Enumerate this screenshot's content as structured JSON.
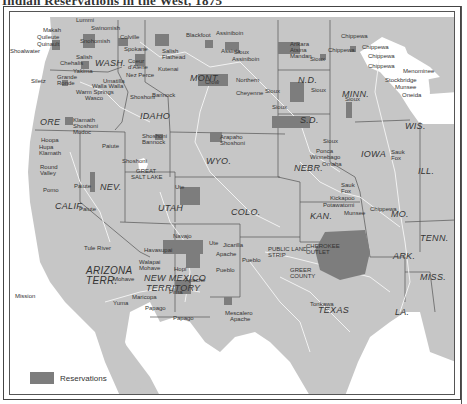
{
  "title": "Indian Reservations in the West, 1875",
  "colors": {
    "land": "#c6c6c6",
    "water": "#ffffff",
    "reservation": "#7d7d7d",
    "rivers": "#f2f2f2",
    "borders": "#555555"
  },
  "legend": {
    "label": "Reservations"
  },
  "states": [
    {
      "id": "wash",
      "label": "WASH.",
      "x": 95,
      "y": 52
    },
    {
      "id": "ore",
      "label": "ORE",
      "x": 38,
      "y": 108
    },
    {
      "id": "idaho",
      "label": "IDAHO",
      "x": 132,
      "y": 112
    },
    {
      "id": "mont",
      "label": "MONT.",
      "x": 186,
      "y": 69
    },
    {
      "id": "wyo",
      "label": "WYO.",
      "x": 197,
      "y": 152
    },
    {
      "id": "nd",
      "label": "N.D.",
      "x": 288,
      "y": 71
    },
    {
      "id": "sd",
      "label": "S.D.",
      "x": 289,
      "y": 114
    },
    {
      "id": "nebr",
      "label": "NEBR.",
      "x": 286,
      "y": 158
    },
    {
      "id": "minn",
      "label": "MINN.",
      "x": 333,
      "y": 85
    },
    {
      "id": "wis",
      "label": "WIS.",
      "x": 395,
      "y": 115
    },
    {
      "id": "iowa",
      "label": "IOWA",
      "x": 353,
      "y": 153
    },
    {
      "id": "ill",
      "label": "ILL.",
      "x": 408,
      "y": 160
    },
    {
      "id": "nev",
      "label": "NEV.",
      "x": 88,
      "y": 167
    },
    {
      "id": "calif",
      "label": "CALIF.",
      "x": 45,
      "y": 195
    },
    {
      "id": "utah",
      "label": "UTAH",
      "x": 147,
      "y": 197
    },
    {
      "id": "colo",
      "label": "COLO.",
      "x": 223,
      "y": 204
    },
    {
      "id": "kan",
      "label": "KAN.",
      "x": 304,
      "y": 213
    },
    {
      "id": "mo",
      "label": "MO.",
      "x": 379,
      "y": 202
    },
    {
      "id": "arizona",
      "label": "ARIZONA",
      "x": 70,
      "y": 263
    },
    {
      "id": "arizona-terr",
      "label": "TERR.",
      "x": 70,
      "y": 274
    },
    {
      "id": "new-mexico",
      "label": "NEW MEXICO",
      "x": 138,
      "y": 269
    },
    {
      "id": "new-mexico-terr",
      "label": "TERRITORY",
      "x": 138,
      "y": 280
    },
    {
      "id": "texas",
      "label": "TEXAS",
      "x": 310,
      "y": 302
    },
    {
      "id": "ark",
      "label": "ARK.",
      "x": 382,
      "y": 248
    },
    {
      "id": "tenn",
      "label": "TENN.",
      "x": 418,
      "y": 225
    },
    {
      "id": "miss",
      "label": "MISS.",
      "x": 418,
      "y": 268
    },
    {
      "id": "la",
      "label": "LA.",
      "x": 393,
      "y": 297
    }
  ],
  "places": [
    {
      "label": "Makah",
      "x": 33,
      "y": 15
    },
    {
      "label": "Quileute",
      "x": 27,
      "y": 22
    },
    {
      "label": "Quinault",
      "x": 27,
      "y": 29
    },
    {
      "label": "Shoalwater",
      "x": 0,
      "y": 36
    },
    {
      "label": "Lummi",
      "x": 66,
      "y": 5
    },
    {
      "label": "Swinomish",
      "x": 81,
      "y": 13
    },
    {
      "label": "Snohomish",
      "x": 70,
      "y": 26
    },
    {
      "label": "Salish",
      "x": 66,
      "y": 42
    },
    {
      "label": "Chehalis",
      "x": 50,
      "y": 48
    },
    {
      "label": "Yakima",
      "x": 63,
      "y": 56
    },
    {
      "label": "Siletz",
      "x": 21,
      "y": 66
    },
    {
      "label": "Grande",
      "x": 47,
      "y": 62
    },
    {
      "label": "Ronde",
      "x": 47,
      "y": 68
    },
    {
      "label": "Umatilla",
      "x": 93,
      "y": 66
    },
    {
      "label": "Walla Walla",
      "x": 82,
      "y": 71
    },
    {
      "label": "Warm Springs",
      "x": 66,
      "y": 77
    },
    {
      "label": "Wasco",
      "x": 75,
      "y": 83
    },
    {
      "label": "Klamath",
      "x": 63,
      "y": 105
    },
    {
      "label": "Shoshoni",
      "x": 63,
      "y": 111
    },
    {
      "label": "Modoc",
      "x": 63,
      "y": 117
    },
    {
      "label": "Colville",
      "x": 110,
      "y": 22
    },
    {
      "label": "Spokane",
      "x": 114,
      "y": 34
    },
    {
      "label": "Coeur",
      "x": 118,
      "y": 46
    },
    {
      "label": "d'Alene",
      "x": 118,
      "y": 52
    },
    {
      "label": "Nez Perce",
      "x": 116,
      "y": 60
    },
    {
      "label": "Blackfoot",
      "x": 176,
      "y": 20
    },
    {
      "label": "Assiniboin",
      "x": 206,
      "y": 18
    },
    {
      "label": "Assinia",
      "x": 211,
      "y": 36
    },
    {
      "label": "Salish",
      "x": 152,
      "y": 36
    },
    {
      "label": "Flathead",
      "x": 152,
      "y": 42
    },
    {
      "label": "Kutenai",
      "x": 148,
      "y": 54
    },
    {
      "label": "Sioux",
      "x": 224,
      "y": 37
    },
    {
      "label": "Assiniboin",
      "x": 222,
      "y": 44
    },
    {
      "label": "Shoshoni",
      "x": 120,
      "y": 82
    },
    {
      "label": "Bannock",
      "x": 142,
      "y": 80
    },
    {
      "label": "Crow",
      "x": 195,
      "y": 67
    },
    {
      "label": "Northern",
      "x": 226,
      "y": 65
    },
    {
      "label": "Cheyenne",
      "x": 226,
      "y": 78
    },
    {
      "label": "Sioux",
      "x": 255,
      "y": 76
    },
    {
      "label": "Arikara",
      "x": 280,
      "y": 29
    },
    {
      "label": "Atsina",
      "x": 280,
      "y": 35
    },
    {
      "label": "Mandan",
      "x": 280,
      "y": 41
    },
    {
      "label": "Chippewa",
      "x": 331,
      "y": 21
    },
    {
      "label": "Chippewa",
      "x": 318,
      "y": 35
    },
    {
      "label": "Chippewa",
      "x": 352,
      "y": 32
    },
    {
      "label": "Chippewa",
      "x": 358,
      "y": 41
    },
    {
      "label": "Chippewa",
      "x": 358,
      "y": 51
    },
    {
      "label": "Sioux",
      "x": 300,
      "y": 44
    },
    {
      "label": "Sioux",
      "x": 262,
      "y": 92
    },
    {
      "label": "Sioux",
      "x": 335,
      "y": 84
    },
    {
      "label": "Sioux",
      "x": 301,
      "y": 75
    },
    {
      "label": "Menominee",
      "x": 393,
      "y": 56
    },
    {
      "label": "Stockbridge",
      "x": 375,
      "y": 65
    },
    {
      "label": "Munsee",
      "x": 385,
      "y": 72
    },
    {
      "label": "Oneida",
      "x": 392,
      "y": 80
    },
    {
      "label": "Arapaho",
      "x": 210,
      "y": 122
    },
    {
      "label": "Shoshoni",
      "x": 210,
      "y": 128
    },
    {
      "label": "Shoshoni",
      "x": 132,
      "y": 121
    },
    {
      "label": "Bannock",
      "x": 132,
      "y": 127
    },
    {
      "label": "Paiute",
      "x": 92,
      "y": 131
    },
    {
      "label": "Shoshoni",
      "x": 112,
      "y": 146
    },
    {
      "label": "Paiute",
      "x": 64,
      "y": 171
    },
    {
      "label": "Hupa",
      "x": 29,
      "y": 132
    },
    {
      "label": "Klamath",
      "x": 29,
      "y": 138
    },
    {
      "label": "Hoopa",
      "x": 31,
      "y": 125
    },
    {
      "label": "Round",
      "x": 30,
      "y": 152
    },
    {
      "label": "Valley",
      "x": 30,
      "y": 158
    },
    {
      "label": "Pomo",
      "x": 33,
      "y": 175
    },
    {
      "label": "Paiute",
      "x": 69,
      "y": 194
    },
    {
      "label": "GREAT",
      "x": 126,
      "y": 156
    },
    {
      "label": "SALT LAKE",
      "x": 121,
      "y": 162
    },
    {
      "label": "Ute",
      "x": 165,
      "y": 172
    },
    {
      "label": "Sioux",
      "x": 313,
      "y": 126
    },
    {
      "label": "Ponca",
      "x": 306,
      "y": 136
    },
    {
      "label": "Winnebago",
      "x": 300,
      "y": 142
    },
    {
      "label": "Omaha",
      "x": 312,
      "y": 149
    },
    {
      "label": "Sauk",
      "x": 381,
      "y": 137
    },
    {
      "label": "Fox",
      "x": 381,
      "y": 143
    },
    {
      "label": "Sauk",
      "x": 331,
      "y": 170
    },
    {
      "label": "Fox",
      "x": 331,
      "y": 176
    },
    {
      "label": "Kickapoo",
      "x": 320,
      "y": 183
    },
    {
      "label": "Potawatomi",
      "x": 313,
      "y": 190
    },
    {
      "label": "Munsee",
      "x": 334,
      "y": 198
    },
    {
      "label": "Chippewa",
      "x": 360,
      "y": 194
    },
    {
      "label": "Tule River",
      "x": 74,
      "y": 233
    },
    {
      "label": "Mission",
      "x": 5,
      "y": 281
    },
    {
      "label": "Mohave",
      "x": 103,
      "y": 264
    },
    {
      "label": "Walapai",
      "x": 129,
      "y": 247
    },
    {
      "label": "Mohave",
      "x": 129,
      "y": 253
    },
    {
      "label": "Havasupai",
      "x": 134,
      "y": 235
    },
    {
      "label": "Yuma",
      "x": 103,
      "y": 288
    },
    {
      "label": "Maricopa",
      "x": 122,
      "y": 282
    },
    {
      "label": "Papago",
      "x": 135,
      "y": 293
    },
    {
      "label": "Papago",
      "x": 163,
      "y": 303
    },
    {
      "label": "Pima",
      "x": 159,
      "y": 277
    },
    {
      "label": "Hopi",
      "x": 164,
      "y": 254
    },
    {
      "label": "Apache",
      "x": 175,
      "y": 265
    },
    {
      "label": "Navajo",
      "x": 163,
      "y": 221
    },
    {
      "label": "Ute",
      "x": 199,
      "y": 228
    },
    {
      "label": "Jicarilla",
      "x": 213,
      "y": 230
    },
    {
      "label": "Apache",
      "x": 206,
      "y": 239
    },
    {
      "label": "Pueblo",
      "x": 232,
      "y": 245
    },
    {
      "label": "Pueblo",
      "x": 206,
      "y": 255
    },
    {
      "label": "Mescalero",
      "x": 215,
      "y": 298
    },
    {
      "label": "Apache",
      "x": 220,
      "y": 304
    },
    {
      "label": "PUBLIC LAND",
      "x": 258,
      "y": 234
    },
    {
      "label": "STRIP",
      "x": 258,
      "y": 240
    },
    {
      "label": "CHEROKEE",
      "x": 296,
      "y": 231
    },
    {
      "label": "OUTLET",
      "x": 296,
      "y": 237
    },
    {
      "label": "GREER",
      "x": 280,
      "y": 255
    },
    {
      "label": "COUNTY",
      "x": 280,
      "y": 261
    },
    {
      "label": "Tonkawa",
      "x": 300,
      "y": 289
    }
  ]
}
